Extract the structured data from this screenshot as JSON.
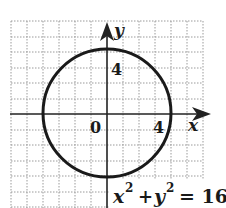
{
  "figure": {
    "equation": "x² + y² = 16",
    "equation_parts": {
      "x": "x",
      "exp1": "2",
      "plus": "+",
      "y": "y",
      "exp2": "2",
      "eq": "= 16"
    },
    "axis_labels": {
      "x": "x",
      "y": "y"
    },
    "tick_labels": {
      "origin": "0",
      "x_tick": "4",
      "y_tick": "4"
    },
    "circle": {
      "center": [
        0,
        0
      ],
      "radius": 4
    },
    "grid": {
      "x_range": [
        -6,
        6
      ],
      "y_range": [
        -6,
        6
      ],
      "step": 1,
      "style": "dotted"
    },
    "colors": {
      "curve": "#1a1a1a",
      "axis": "#222222",
      "grid": "#9a9a9a",
      "background": "#ffffff"
    }
  }
}
